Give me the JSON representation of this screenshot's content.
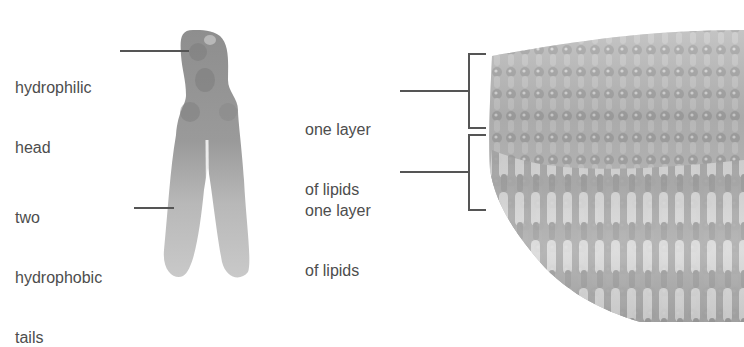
{
  "figure": {
    "molecule": {
      "labels": [
        {
          "id": "head",
          "line1": "hydrophilic",
          "line2": "head"
        },
        {
          "id": "tails",
          "line1": "two",
          "line2": "hydrophobic",
          "line3": "tails"
        }
      ]
    },
    "bilayer": {
      "labels": [
        {
          "id": "upper-layer",
          "line1": "one layer",
          "line2": "of lipids"
        },
        {
          "id": "lower-layer",
          "line1": "one layer",
          "line2": "of lipids"
        }
      ]
    },
    "colors": {
      "text": "#4d4d4d",
      "leader_line": "#555555",
      "molecule_fill": "#a8a8a8",
      "molecule_head": "#8c8c8c",
      "background": "#ffffff"
    }
  }
}
